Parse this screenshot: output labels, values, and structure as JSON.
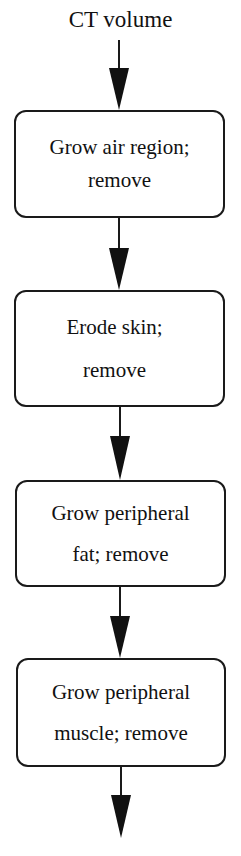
{
  "diagram": {
    "input_label": "CT volume",
    "steps": [
      {
        "line1": "Grow air region;",
        "line2": "remove"
      },
      {
        "line1": "Erode skin;",
        "line2": "remove"
      },
      {
        "line1": "Grow peripheral",
        "line2": "fat; remove"
      },
      {
        "line1": "Grow peripheral",
        "line2": "muscle; remove"
      }
    ],
    "colors": {
      "stroke": "#1a1a1a",
      "background": "#ffffff"
    }
  }
}
